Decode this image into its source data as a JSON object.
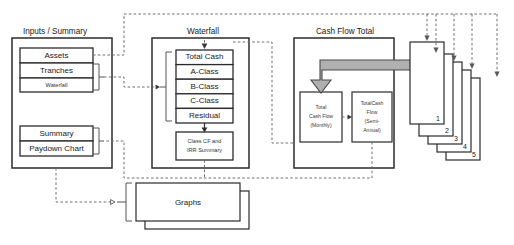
{
  "diagram": {
    "groups": [
      {
        "id": "inputs-summary",
        "label": "Inputs / Summary",
        "items": [
          {
            "id": "assets",
            "label": "Assets"
          },
          {
            "id": "tranches",
            "label": "Tranches"
          },
          {
            "id": "waterfall-input",
            "label": "Waterfall"
          },
          {
            "id": "summary",
            "label": "Summary"
          },
          {
            "id": "paydown-chart",
            "label": "Paydown Chart"
          }
        ]
      },
      {
        "id": "waterfall",
        "label": "Waterfall",
        "items": [
          {
            "id": "total-cash",
            "label": "Total Cash"
          },
          {
            "id": "a-class",
            "label": "A-Class"
          },
          {
            "id": "b-class",
            "label": "B-Class"
          },
          {
            "id": "c-class",
            "label": "C-Class"
          },
          {
            "id": "residual",
            "label": "Residual"
          },
          {
            "id": "class-cf-irr",
            "label_line1": "Class CF and",
            "label_line2": "IRR Summary"
          }
        ]
      },
      {
        "id": "cash-flow-total",
        "label": "Cash Flow Total",
        "items": [
          {
            "id": "total-cash-flow-monthly",
            "label_line1": "Total",
            "label_line2": "Cash Flow",
            "label_line3": "(Monthly)"
          },
          {
            "id": "total-cash-flow-semi-annual",
            "label_line1": "TotalCash",
            "label_line2": "Flow",
            "label_line3": "(Semi-",
            "label_line4": "Annual)"
          }
        ]
      },
      {
        "id": "graphs",
        "label": "Graphs",
        "items": [
          {
            "id": "graphs-sheet",
            "label": "Graphs"
          }
        ]
      }
    ],
    "stack": {
      "id": "scenario-stack",
      "labels": [
        "1",
        "2",
        "3",
        "4",
        "5"
      ]
    },
    "colors": {
      "stroke": "#2b2b2b",
      "dashed_stroke": "#6e6e6e",
      "gray_arrow_fill": "#b0b0b0",
      "gray_arrow_stroke": "#4a4a4a",
      "background": "#ffffff",
      "text": "#1a1a1a"
    }
  }
}
